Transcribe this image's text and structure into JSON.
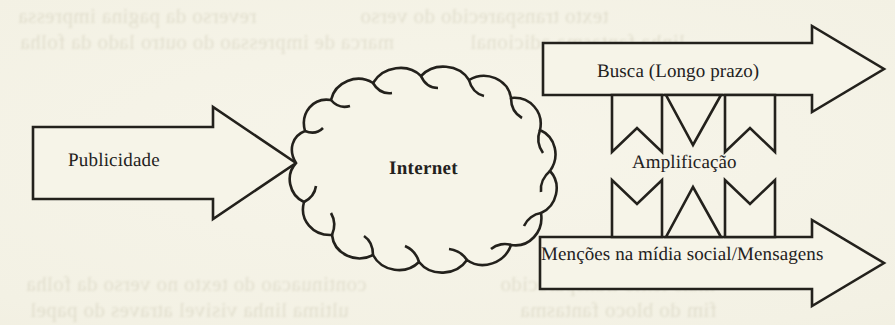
{
  "page": {
    "medium": "scanned-book-page",
    "paper_color": "#f3f1e4",
    "ink_color": "#23211c",
    "ghost_ink_color": "#b9b49a"
  },
  "diagram": {
    "type": "flow-diagram",
    "nodes": [
      {
        "id": "publicidade",
        "shape": "right-arrow",
        "label": "Publicidade",
        "role": "input"
      },
      {
        "id": "internet",
        "shape": "cloud",
        "label": "Internet",
        "role": "hub",
        "bold": true
      },
      {
        "id": "busca",
        "shape": "right-arrow",
        "label": "Busca (Longo prazo)",
        "role": "output-top"
      },
      {
        "id": "mencoes",
        "shape": "right-arrow",
        "label": "Menções na mídia social/Mensagens",
        "role": "output-bottom"
      },
      {
        "id": "amplificacao",
        "shape": "bidirectional-exchange",
        "label": "Amplificação",
        "role": "feedback-between-outputs"
      }
    ],
    "edges": [
      {
        "from": "publicidade",
        "to": "internet"
      },
      {
        "from": "internet",
        "to": "busca"
      },
      {
        "from": "internet",
        "to": "mencoes"
      },
      {
        "from": "busca",
        "to": "mencoes",
        "via": "amplificacao",
        "bidirectional": true
      }
    ]
  },
  "ghost_text": {
    "lines": [
      {
        "x": 18,
        "y": 4,
        "text": "reverso da pagina impressa"
      },
      {
        "x": 360,
        "y": 4,
        "text": "texto transparecido do verso"
      },
      {
        "x": 20,
        "y": 30,
        "text": "marca de impressao do outro lado da folha"
      },
      {
        "x": 470,
        "y": 30,
        "text": "linha fantasma adicional"
      },
      {
        "x": 26,
        "y": 272,
        "text": "continuacao do texto no verso da folha"
      },
      {
        "x": 500,
        "y": 272,
        "text": "mais texto transparecido"
      },
      {
        "x": 30,
        "y": 298,
        "text": "ultima linha visivel atraves do papel"
      },
      {
        "x": 520,
        "y": 298,
        "text": "fim do bloco fantasma"
      }
    ]
  }
}
